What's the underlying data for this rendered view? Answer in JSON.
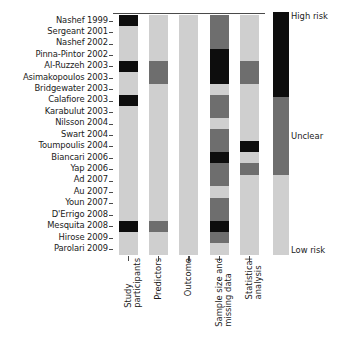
{
  "chart_data": {
    "type": "heatmap",
    "title": "",
    "xlabel": "",
    "ylabel": "",
    "grid": false,
    "legend_position": "right",
    "categories_x": [
      "Study participants",
      "Predictors",
      "Outcome",
      "Sample size and missing data",
      "Statistical analysis"
    ],
    "categories_y": [
      "Nashef 1999",
      "Sergeant 2001",
      "Nashef 2002",
      "Pinna-Pintor 2002",
      "Al-Ruzzeh 2003",
      "Asimakopoulos 2003",
      "Bridgewater 2003",
      "Calafiore 2003",
      "Karabulut 2003",
      "Nilsson 2004",
      "Swart 2004",
      "Toumpoulis 2004",
      "Biancari 2006",
      "Yap 2006",
      "Ad 2007",
      "Au 2007",
      "Youn 2007",
      "D'Errigo 2008",
      "Mesquita 2008",
      "Hirose 2009",
      "Parolari 2009"
    ],
    "value_levels": [
      "low",
      "unclear",
      "high"
    ],
    "level_labels": {
      "high": "High risk",
      "unclear": "Unclear",
      "low": "Low risk"
    },
    "level_colors": {
      "high": "#0d0d0d",
      "unclear": "#6e6e6e",
      "low": "#cfcfcf"
    },
    "values": [
      [
        "high",
        "low",
        "low",
        "unclear",
        "low"
      ],
      [
        "low",
        "low",
        "low",
        "unclear",
        "low"
      ],
      [
        "low",
        "low",
        "low",
        "unclear",
        "low"
      ],
      [
        "low",
        "low",
        "low",
        "high",
        "low"
      ],
      [
        "high",
        "unclear",
        "low",
        "high",
        "unclear"
      ],
      [
        "low",
        "unclear",
        "low",
        "high",
        "unclear"
      ],
      [
        "low",
        "low",
        "low",
        "low",
        "low"
      ],
      [
        "high",
        "low",
        "low",
        "unclear",
        "low"
      ],
      [
        "low",
        "low",
        "low",
        "unclear",
        "low"
      ],
      [
        "low",
        "low",
        "low",
        "low",
        "low"
      ],
      [
        "low",
        "low",
        "low",
        "unclear",
        "low"
      ],
      [
        "low",
        "low",
        "low",
        "unclear",
        "high"
      ],
      [
        "low",
        "low",
        "low",
        "high",
        "low"
      ],
      [
        "low",
        "low",
        "low",
        "unclear",
        "unclear"
      ],
      [
        "low",
        "low",
        "low",
        "unclear",
        "low"
      ],
      [
        "low",
        "low",
        "low",
        "low",
        "low"
      ],
      [
        "low",
        "low",
        "low",
        "unclear",
        "low"
      ],
      [
        "low",
        "low",
        "low",
        "unclear",
        "low"
      ],
      [
        "high",
        "unclear",
        "low",
        "high",
        "low"
      ],
      [
        "low",
        "low",
        "low",
        "unclear",
        "low"
      ],
      [
        "low",
        "low",
        "low",
        "low",
        "low"
      ]
    ]
  },
  "legend": {
    "bands": [
      {
        "label": "High risk",
        "color": "#0d0d0d",
        "fraction": 35
      },
      {
        "label": "Unclear",
        "color": "#6e6e6e",
        "fraction": 32
      },
      {
        "label": "Low risk",
        "color": "#cfcfcf",
        "fraction": 33
      }
    ]
  },
  "column_labels": [
    {
      "line1": "Study",
      "line2": "participants"
    },
    {
      "line1": "Predictors",
      "line2": ""
    },
    {
      "line1": "Outcome",
      "line2": ""
    },
    {
      "line1": "Sample size and",
      "line2": "missing data"
    },
    {
      "line1": "Statistical",
      "line2": "analysis"
    }
  ]
}
